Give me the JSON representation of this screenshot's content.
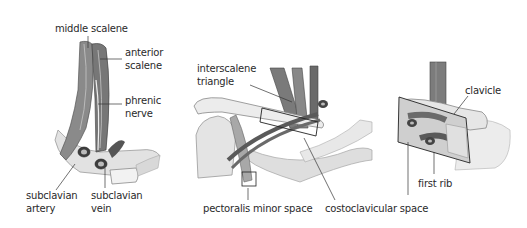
{
  "figure": {
    "panels": [
      {
        "id": "scalene-view",
        "labels": {
          "middle_scalene": "middle scalene",
          "anterior_scalene_1": "anterior",
          "anterior_scalene_2": "scalene",
          "phrenic_nerve_1": "phrenic",
          "phrenic_nerve_2": "nerve",
          "subclavian_artery_1": "subclavian",
          "subclavian_artery_2": "artery",
          "subclavian_vein_1": "subclavian",
          "subclavian_vein_2": "vein"
        }
      },
      {
        "id": "shoulder-view",
        "labels": {
          "interscalene_triangle_1": "interscalene",
          "interscalene_triangle_2": "triangle",
          "pectoralis_minor_space": "pectoralis minor space",
          "costoclavicular_space": "costoclavicular space"
        }
      },
      {
        "id": "costoclavicular-detail",
        "labels": {
          "clavicle": "clavicle",
          "first_rib": "first rib"
        }
      }
    ],
    "colors": {
      "ink": "#2a2a2a",
      "muscle_dark": "#6e6e6e",
      "muscle_mid": "#9a9a9a",
      "bone_light": "#dcdcdc",
      "bone_shade": "#bdbdbd",
      "background": "#ffffff"
    }
  }
}
